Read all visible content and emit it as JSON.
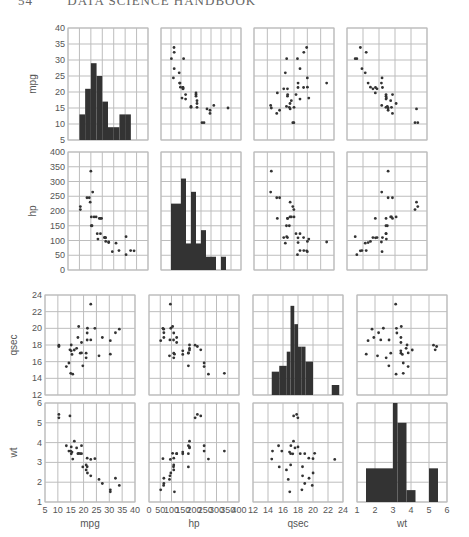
{
  "header": {
    "page_number": "54",
    "title": "DATA SCIENCE HANDBOOK"
  },
  "chart_data": {
    "type": "scatter",
    "variables": [
      "mpg",
      "hp",
      "qsec",
      "wt"
    ],
    "diagonal": "histogram",
    "axes": {
      "mpg": {
        "range": [
          5,
          40
        ],
        "ticks": [
          5,
          10,
          15,
          20,
          25,
          30,
          35,
          40
        ]
      },
      "hp": {
        "range": [
          0,
          400
        ],
        "ticks": [
          0,
          50,
          100,
          150,
          200,
          250,
          300,
          350,
          400
        ]
      },
      "qsec": {
        "range": [
          12,
          24
        ],
        "ticks": [
          12,
          14,
          16,
          18,
          20,
          22,
          24
        ]
      },
      "wt": {
        "range": [
          1,
          6
        ],
        "ticks": [
          1,
          2,
          3,
          4,
          5,
          6
        ]
      }
    },
    "histograms": {
      "mpg": {
        "bin_edges": [
          10,
          12.5,
          15,
          17.5,
          20,
          22.5,
          25,
          27.5,
          30,
          32.5,
          35
        ],
        "heights": [
          13,
          21,
          29,
          25,
          17,
          9,
          9,
          13,
          13,
          0
        ]
      },
      "hp": {
        "bin_edges": [
          50,
          75,
          100,
          125,
          150,
          175,
          200,
          225,
          250,
          275,
          300,
          325,
          350
        ],
        "heights": [
          225,
          225,
          310,
          90,
          265,
          90,
          135,
          45,
          45,
          0,
          45,
          0
        ]
      },
      "qsec": {
        "bin_edges": [
          14.5,
          15.5,
          16.5,
          17,
          17.5,
          18,
          18.5,
          19,
          20,
          22.5,
          23.5
        ],
        "heights": [
          14.8,
          15.5,
          17.2,
          22.7,
          20.5,
          17.8,
          17.8,
          16.0,
          0,
          13.2
        ]
      },
      "wt": {
        "bin_edges": [
          1.5,
          2,
          2.5,
          3,
          3.25,
          3.5,
          3.75,
          4,
          4.25,
          5,
          5.5
        ],
        "heights": [
          2.7,
          2.7,
          2.7,
          6.0,
          5.0,
          5.0,
          1.6,
          1.6,
          0,
          2.7
        ]
      }
    },
    "points": {
      "mpg": [
        21,
        21,
        22.8,
        21.4,
        18.7,
        18.1,
        14.3,
        24.4,
        22.8,
        19.2,
        17.8,
        16.4,
        17.3,
        15.2,
        10.4,
        10.4,
        14.7,
        32.4,
        30.4,
        33.9,
        21.5,
        15.5,
        15.2,
        13.3,
        19.2,
        27.3,
        26,
        30.4,
        15.8,
        19.7,
        15,
        21.4
      ],
      "hp": [
        110,
        110,
        93,
        110,
        175,
        105,
        245,
        62,
        95,
        123,
        123,
        180,
        180,
        180,
        205,
        215,
        230,
        66,
        52,
        65,
        97,
        150,
        150,
        245,
        175,
        66,
        91,
        113,
        264,
        175,
        335,
        109
      ],
      "qsec": [
        16.46,
        17.02,
        18.61,
        19.44,
        17.02,
        20.22,
        15.84,
        20,
        22.9,
        18.3,
        18.9,
        17.4,
        17.6,
        18,
        17.98,
        17.82,
        17.42,
        19.47,
        18.52,
        19.9,
        20.01,
        16.87,
        17.3,
        15.41,
        17.05,
        18.9,
        16.7,
        16.9,
        14.5,
        15.5,
        14.6,
        18.6
      ],
      "wt": [
        2.62,
        2.875,
        2.32,
        3.215,
        3.44,
        3.46,
        3.57,
        3.19,
        3.15,
        3.44,
        3.44,
        4.07,
        3.73,
        3.78,
        5.25,
        5.424,
        5.345,
        2.2,
        1.615,
        1.835,
        2.465,
        3.52,
        3.435,
        3.84,
        3.845,
        1.935,
        2.14,
        1.513,
        3.17,
        2.77,
        3.57,
        2.78
      ]
    },
    "xlabels": [
      "mpg",
      "hp",
      "qsec",
      "wt"
    ],
    "ylabels": [
      "mpg",
      "hp",
      "qsec",
      "wt"
    ],
    "grid": true,
    "colors": {
      "grid": "#bdbdbd",
      "bar": "#333333",
      "point": "#333333",
      "border": "#bdbdbd"
    }
  }
}
